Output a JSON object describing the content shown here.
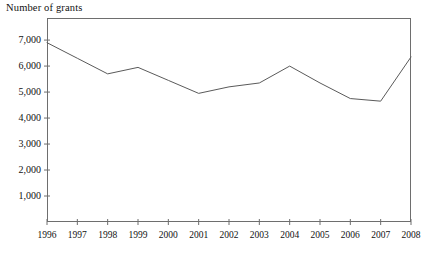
{
  "chart_data": {
    "type": "line",
    "title": "",
    "ylabel": "Number of grants",
    "xlabel": "",
    "x": [
      1996,
      1997,
      1998,
      1999,
      2000,
      2001,
      2002,
      2003,
      2004,
      2005,
      2006,
      2007,
      2008
    ],
    "categories": [
      "1996",
      "1997",
      "1998",
      "1999",
      "2000",
      "2001",
      "2002",
      "2003",
      "2004",
      "2005",
      "2006",
      "2007",
      "2008"
    ],
    "values": [
      6900,
      6300,
      5700,
      5950,
      5450,
      4950,
      5200,
      5350,
      6000,
      5350,
      4750,
      4650,
      6350
    ],
    "series": [
      {
        "name": "Number of grants",
        "values": [
          6900,
          6300,
          5700,
          5950,
          5450,
          4950,
          5200,
          5350,
          6000,
          5350,
          4750,
          4650,
          6350
        ]
      }
    ],
    "ylim": [
      0,
      7850
    ],
    "xlim": [
      1996,
      2008
    ],
    "yticks": [
      1000,
      2000,
      3000,
      4000,
      5000,
      6000,
      7000
    ],
    "ytick_labels": [
      "1,000",
      "2,000",
      "3,000",
      "4,000",
      "5,000",
      "6,000",
      "7,000"
    ],
    "xticks": [
      1996,
      1997,
      1998,
      1999,
      2000,
      2001,
      2002,
      2003,
      2004,
      2005,
      2006,
      2007,
      2008
    ],
    "xtick_labels": [
      "1996",
      "1997",
      "1998",
      "1999",
      "2000",
      "2001",
      "2002",
      "2003",
      "2004",
      "2005",
      "2006",
      "2007",
      "2008"
    ],
    "grid": false,
    "legend": false,
    "legend_position": "none",
    "line_color": "#5a5a5a",
    "frame_color": "#6e6e6e",
    "text_color": "#111111",
    "background": "#ffffff"
  }
}
